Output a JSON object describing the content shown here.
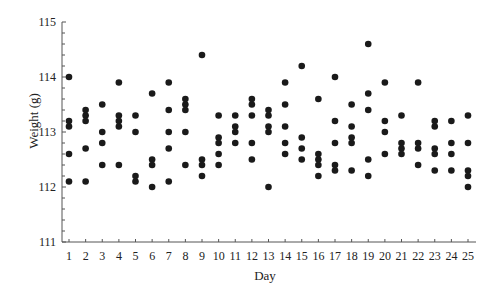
{
  "chart_data": {
    "type": "scatter",
    "title": "",
    "xlabel": "Day",
    "ylabel": "Weight (g)",
    "xlim": [
      1,
      25
    ],
    "ylim": [
      111,
      115
    ],
    "grid": false,
    "legend": null,
    "x_ticks": [
      1,
      2,
      3,
      4,
      5,
      6,
      7,
      8,
      9,
      10,
      11,
      12,
      13,
      14,
      15,
      16,
      17,
      18,
      19,
      20,
      21,
      22,
      23,
      24,
      25
    ],
    "y_ticks": [
      111,
      112,
      113,
      114,
      115
    ],
    "y_minor_step": 0.2,
    "marker_color": "#1a1a1a",
    "points_by_day": [
      {
        "day": 1,
        "values": [
          114.0,
          113.2,
          113.1,
          112.6,
          112.1
        ]
      },
      {
        "day": 2,
        "values": [
          113.4,
          113.3,
          113.2,
          112.7,
          112.1
        ]
      },
      {
        "day": 3,
        "values": [
          113.5,
          113.0,
          112.8,
          112.4
        ]
      },
      {
        "day": 4,
        "values": [
          113.9,
          113.3,
          113.2,
          113.1,
          112.4
        ]
      },
      {
        "day": 5,
        "values": [
          113.3,
          113.0,
          112.2,
          112.1
        ]
      },
      {
        "day": 6,
        "values": [
          113.7,
          112.5,
          112.4,
          112.0
        ]
      },
      {
        "day": 7,
        "values": [
          113.9,
          113.4,
          113.0,
          112.7,
          112.1
        ]
      },
      {
        "day": 8,
        "values": [
          113.6,
          113.5,
          113.4,
          113.0,
          112.4
        ]
      },
      {
        "day": 9,
        "values": [
          114.4,
          112.5,
          112.4,
          112.2
        ]
      },
      {
        "day": 10,
        "values": [
          113.3,
          112.9,
          112.8,
          112.6,
          112.4
        ]
      },
      {
        "day": 11,
        "values": [
          113.3,
          113.1,
          113.0,
          112.8
        ]
      },
      {
        "day": 12,
        "values": [
          113.6,
          113.5,
          113.3,
          112.8,
          112.5
        ]
      },
      {
        "day": 13,
        "values": [
          113.4,
          113.3,
          113.1,
          113.0,
          112.0
        ]
      },
      {
        "day": 14,
        "values": [
          113.9,
          113.5,
          113.1,
          112.8,
          112.6
        ]
      },
      {
        "day": 15,
        "values": [
          114.2,
          112.9,
          112.7,
          112.5
        ]
      },
      {
        "day": 16,
        "values": [
          113.6,
          112.6,
          112.5,
          112.4,
          112.2
        ]
      },
      {
        "day": 17,
        "values": [
          114.0,
          113.2,
          112.8,
          112.4,
          112.3
        ]
      },
      {
        "day": 18,
        "values": [
          113.5,
          113.1,
          112.9,
          112.8,
          112.3
        ]
      },
      {
        "day": 19,
        "values": [
          114.6,
          113.7,
          113.4,
          112.5,
          112.2
        ]
      },
      {
        "day": 20,
        "values": [
          113.9,
          113.2,
          113.0,
          112.6
        ]
      },
      {
        "day": 21,
        "values": [
          113.3,
          112.8,
          112.7,
          112.6
        ]
      },
      {
        "day": 22,
        "values": [
          113.9,
          112.8,
          112.7,
          112.4
        ]
      },
      {
        "day": 23,
        "values": [
          113.2,
          113.1,
          112.7,
          112.6,
          112.3
        ]
      },
      {
        "day": 24,
        "values": [
          113.2,
          112.8,
          112.6,
          112.3
        ]
      },
      {
        "day": 25,
        "values": [
          113.3,
          112.8,
          112.3,
          112.2,
          112.0
        ]
      }
    ]
  }
}
